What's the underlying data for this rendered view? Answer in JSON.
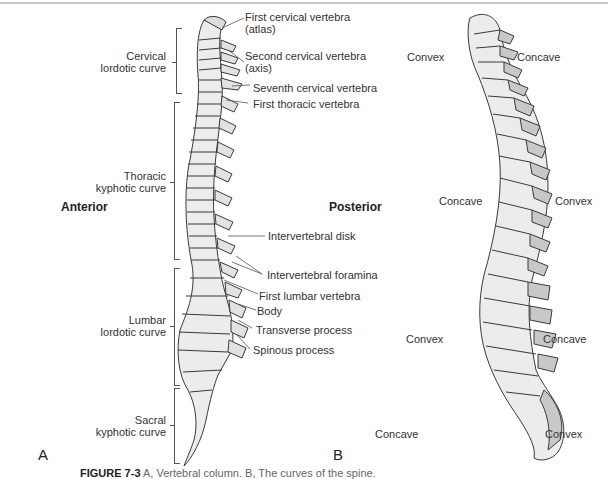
{
  "figure": {
    "panel_a": {
      "letter": "A",
      "orientation": {
        "left": "Anterior",
        "right": "Posterior"
      },
      "curves": [
        {
          "line1": "Cervical",
          "line2": "lordotic curve"
        },
        {
          "line1": "Thoracic",
          "line2": "kyphotic curve"
        },
        {
          "line1": "Lumbar",
          "line2": "lordotic curve"
        },
        {
          "line1": "Sacral",
          "line2": "kyphotic curve"
        }
      ],
      "labels": [
        {
          "line1": "First cervical vertebra",
          "line2": "(atlas)"
        },
        {
          "line1": "Second cervical vertebra",
          "line2": "(axis)"
        },
        {
          "line1": "Seventh cervical vertebra"
        },
        {
          "line1": "First thoracic vertebra"
        },
        {
          "line1": "Intervertebral disk"
        },
        {
          "line1": "Intervertebral foramina"
        },
        {
          "line1": "First lumbar vertebra"
        },
        {
          "line1": "Body"
        },
        {
          "line1": "Transverse process"
        },
        {
          "line1": "Spinous process"
        }
      ]
    },
    "panel_b": {
      "letter": "B",
      "labels": {
        "cervical_left": "Convex",
        "cervical_right": "Concave",
        "thoracic_left": "Concave",
        "thoracic_right": "Convex",
        "lumbar_left": "Convex",
        "lumbar_right": "Concave",
        "sacral_left": "Concave",
        "sacral_right": "Convex"
      }
    },
    "caption": {
      "prefix": "FIGURE 7-3",
      "text": "A, Vertebral column. B, The curves of the spine."
    },
    "colors": {
      "bone": "#ececec",
      "bone_shade": "#c8c8c8",
      "outline": "#3a3a3a",
      "line": "#555555"
    }
  }
}
